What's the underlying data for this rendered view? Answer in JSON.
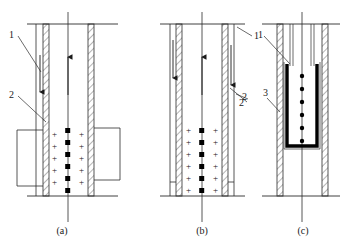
{
  "figure": {
    "kind": "technical-line-diagram",
    "panel_count": 3,
    "captions": [
      "(a)",
      "(b)",
      "(c)"
    ],
    "stroke_color": "#2b2b2b",
    "fill_black": "#000000",
    "background": "#ffffff",
    "charge_symbol": "+",
    "panels": [
      {
        "id": "a",
        "caption": "(a)",
        "labels": [
          {
            "text": "1",
            "x": 9,
            "y": 37
          },
          {
            "text": "2",
            "x": 9,
            "y": 95
          }
        ],
        "arrows": [
          {
            "name": "left-downward-arrow",
            "direction": "down"
          },
          {
            "name": "center-upward-arrow",
            "direction": "up"
          }
        ],
        "center_dot_count": 6,
        "left_plus_count": 5,
        "right_plus_count": 5,
        "side_box_left": true,
        "side_box_right": true
      },
      {
        "id": "b",
        "caption": "(b)",
        "labels": [
          {
            "text": "1",
            "x": 243,
            "y": 33
          },
          {
            "text": "2",
            "x": 238,
            "y": 103
          }
        ],
        "arrows": [
          {
            "name": "left-downward-arrow",
            "direction": "down"
          },
          {
            "name": "center-upward-arrow",
            "direction": "up"
          },
          {
            "name": "right-downward-arrow",
            "direction": "down"
          }
        ],
        "center_dot_count": 6,
        "left_plus_count": 6,
        "right_plus_count": 6,
        "side_box_left": true,
        "side_box_right": true
      },
      {
        "id": "c",
        "caption": "(c)",
        "labels": [
          {
            "text": "1",
            "x": 257,
            "y": 35
          },
          {
            "text": "2",
            "x": 240,
            "y": 97
          },
          {
            "text": "3",
            "x": 262,
            "y": 93
          }
        ],
        "arrows": [],
        "center_dot_count": 6,
        "electrode_shape": "u-shaped-black-bar",
        "side_box_left": false,
        "side_box_right": false
      }
    ]
  }
}
